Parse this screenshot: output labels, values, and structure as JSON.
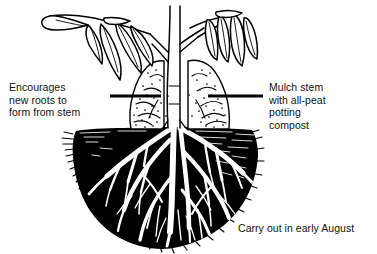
{
  "figure": {
    "background_color": "#ffffff",
    "ink_color": "#000000",
    "width": 377,
    "height": 254
  },
  "annotations": {
    "left": {
      "name": "encourages-new-roots-label",
      "text": "Encourages\nnew roots to\nform from stem"
    },
    "right": {
      "name": "mulch-stem-label",
      "text": "Mulch stem\nwith all-peat\npotting\ncompost"
    },
    "bottom": {
      "name": "timing-label",
      "text": "Carry out in early August"
    }
  },
  "drawing": {
    "plant": {
      "stem_label": "plant-stem",
      "leaf_cluster_left": "left-leaf-cluster",
      "leaf_cluster_right": "right-leaf-cluster"
    },
    "mulch_mound": {
      "label": "mulch-mound",
      "fill": "#ffffff",
      "stipple_color": "#000000"
    },
    "soil_mass": {
      "label": "soil-mass",
      "fill": "#000000"
    },
    "roots": {
      "label": "root-system",
      "color": "#ffffff"
    },
    "pointer_line": {
      "label": "soil-level-pointer-line",
      "color": "#000000",
      "left_segment": "110 to 160 at y=96",
      "right_segment": "208 to 263 at y=96"
    }
  }
}
